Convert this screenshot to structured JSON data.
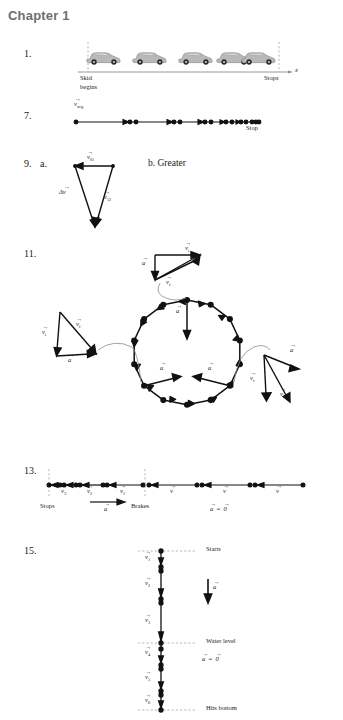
{
  "page": {
    "chapter_title": "Chapter 1",
    "width": 343,
    "height": 720,
    "background": "#ffffff",
    "ink": "#1a1a1a",
    "title_color": "#6e6e6e"
  },
  "problems": [
    {
      "number": "1.",
      "type": "motion-diagram-cars",
      "labels": {
        "start": "Skid",
        "start_line2": "begins",
        "stop": "Stops",
        "axis": "x"
      },
      "car_positions": [
        0,
        46,
        92,
        130,
        155
      ],
      "car_count": 5,
      "description": "Car skidding to a stop; spacing between successive car images decreases."
    },
    {
      "number": "7.",
      "type": "motion-diagram-dots",
      "labels": {
        "v_avg": "v",
        "v_avg_sub": "avg",
        "stop": "Stop"
      },
      "dot_positions": [
        0,
        54,
        58,
        95,
        99,
        124,
        128,
        146,
        150,
        160,
        164,
        171,
        175,
        180
      ],
      "description": "Dot motion diagram with decreasing spacing ending at Stop."
    },
    {
      "number": "9.",
      "part_a": "a.",
      "part_b": "b. Greater",
      "type": "vector-triangle",
      "labels": {
        "v01": "v",
        "v01_sub": "01",
        "v12": "v",
        "v12_sub": "12",
        "delta_v": "Δv"
      },
      "description": "Vector subtraction triangle with v01 on top pointing left, v12 on right side, and delta-v on the left side."
    },
    {
      "number": "11.",
      "type": "circular-motion-diagram",
      "labels": {
        "a": "a",
        "v_i": "v",
        "v_i_sub": "i",
        "v_f": "v",
        "v_f_sub": "f"
      },
      "polygon_vertices": 16,
      "callouts": [
        {
          "position": "top",
          "label_a": "a",
          "label_vi": "v",
          "label_vi_sub": "i",
          "label_vf": "v",
          "label_vf_sub": "f"
        },
        {
          "position": "left",
          "label_a": "a",
          "label_vi": "v",
          "label_vi_sub": "i",
          "label_vf": "v",
          "label_vf_sub": "f"
        },
        {
          "position": "right",
          "label_a": "a",
          "label_vi": "v",
          "label_vi_sub": "i",
          "label_vf": "v",
          "label_vf_sub": "f"
        }
      ],
      "description": "Uniform circular motion diagram: 16-sided polygon of velocity vectors with acceleration vectors pointing toward center; three vector-subtraction callout triangles."
    },
    {
      "number": "13.",
      "type": "motion-diagram-line",
      "labels": {
        "stops": "Stops",
        "brakes": "Brakes",
        "a_arrow": "a",
        "a_zero": "a = 0",
        "v3": "v",
        "v3_sub": "3",
        "v2": "v",
        "v2_sub": "2",
        "v1": "v",
        "v1_sub": "1",
        "v": "v"
      },
      "segments_left": [
        "v3",
        "v2",
        "v1"
      ],
      "segments_right": [
        "v",
        "v",
        "v"
      ],
      "description": "Car braking: constant velocity at right, decelerating to a stop at left."
    },
    {
      "number": "15.",
      "type": "vertical-motion-diagram",
      "labels": {
        "starts": "Starts",
        "water_level": "Water level",
        "hits_bottom": "Hits bottom",
        "a": "a",
        "a_zero": "a = 0",
        "v1": "v",
        "v1_sub": "1",
        "v2": "v",
        "v2_sub": "2",
        "v3": "v",
        "v3_sub": "3",
        "v4": "v",
        "v4_sub": "4",
        "v5": "v",
        "v5_sub": "5",
        "v6": "v",
        "v6_sub": "6"
      },
      "segments": [
        "v1",
        "v2",
        "v3",
        "v4",
        "v5",
        "v6"
      ],
      "description": "Object falling into water: accelerating above water level, constant velocity below to the bottom."
    }
  ]
}
